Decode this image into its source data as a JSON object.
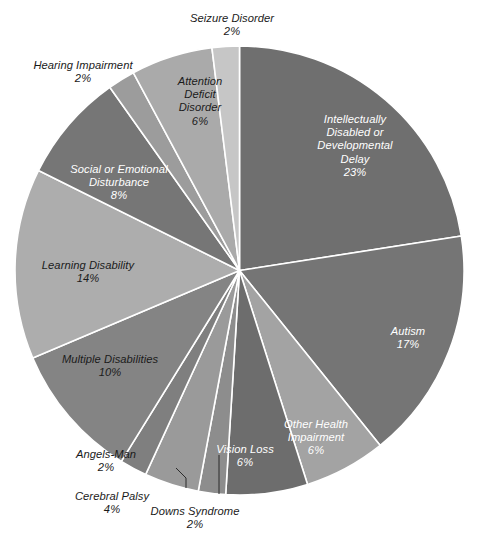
{
  "chart_data": {
    "type": "pie",
    "title": "",
    "subtitle": "",
    "xlabel": "",
    "ylabel": "",
    "legend_position": "none",
    "grid": false,
    "label_format": "name + percent",
    "start_angle_deg": 0,
    "direction": "clockwise",
    "total_percent": 100,
    "categories": [
      "Intellectually Disabled or Developmental Delay",
      "Autism",
      "Other Health Impairment",
      "Vision Loss",
      "Downs Syndrome",
      "Cerebral Palsy",
      "Angels-Man",
      "Multiple Disabilities",
      "Learning Disability",
      "Social or Emotional Disturbance",
      "Hearing Impairment",
      "Attention Deficit Disorder",
      "Seizure Disorder"
    ],
    "values": [
      23,
      17,
      6,
      6,
      2,
      4,
      2,
      10,
      14,
      8,
      2,
      6,
      2
    ],
    "slices": [
      {
        "name": "Intellectually Disabled or Developmental Delay",
        "label": "Intellectually\nDisabled or\nDevelopmental\nDelay",
        "percent_text": "23%",
        "value": 23,
        "color": "#6f6f6f",
        "label_placement": "inside",
        "label_color": "#ffffff"
      },
      {
        "name": "Autism",
        "label": "Autism",
        "percent_text": "17%",
        "value": 17,
        "color": "#757575",
        "label_placement": "inside",
        "label_color": "#ffffff"
      },
      {
        "name": "Other Health Impairment",
        "label": "Other Health\nImpairment",
        "percent_text": "6%",
        "value": 6,
        "color": "#a3a3a3",
        "label_placement": "inside",
        "label_color": "#ffffff"
      },
      {
        "name": "Vision Loss",
        "label": "Vision Loss",
        "percent_text": "6%",
        "value": 6,
        "color": "#6d6d6d",
        "label_placement": "inside",
        "label_color": "#ffffff"
      },
      {
        "name": "Downs Syndrome",
        "label": "Downs Syndrome",
        "percent_text": "2%",
        "value": 2,
        "color": "#8d8d8d",
        "label_placement": "outside-leader",
        "label_color": "#1a1a1a"
      },
      {
        "name": "Cerebral Palsy",
        "label": "Cerebral Palsy",
        "percent_text": "4%",
        "value": 4,
        "color": "#9a9a9a",
        "label_placement": "outside-leader",
        "label_color": "#1a1a1a"
      },
      {
        "name": "Angels-Man",
        "label": "Angels-Man",
        "percent_text": "2%",
        "value": 2,
        "color": "#7f7f7f",
        "label_placement": "outside",
        "label_color": "#1a1a1a"
      },
      {
        "name": "Multiple Disabilities",
        "label": "Multiple Disabilities",
        "percent_text": "10%",
        "value": 10,
        "color": "#848484",
        "label_placement": "inside",
        "label_color": "#1b1b1b"
      },
      {
        "name": "Learning Disability",
        "label": "Learning Disability",
        "percent_text": "14%",
        "value": 14,
        "color": "#adadad",
        "label_placement": "inside",
        "label_color": "#1b1b1b"
      },
      {
        "name": "Social or Emotional Disturbance",
        "label": "Social or Emotional\nDisturbance",
        "percent_text": "8%",
        "value": 8,
        "color": "#767676",
        "label_placement": "inside",
        "label_color": "#ffffff"
      },
      {
        "name": "Hearing Impairment",
        "label": "Hearing Impairment",
        "percent_text": "2%",
        "value": 2,
        "color": "#9c9c9c",
        "label_placement": "outside",
        "label_color": "#1a1a1a"
      },
      {
        "name": "Attention Deficit Disorder",
        "label": "Attention\nDeficit\nDisorder",
        "percent_text": "6%",
        "value": 6,
        "color": "#aaaaaa",
        "label_placement": "inside",
        "label_color": "#1b1b1b"
      },
      {
        "name": "Seizure Disorder",
        "label": "Seizure Disorder",
        "percent_text": "2%",
        "value": 2,
        "color": "#c6c6c6",
        "label_placement": "outside",
        "label_color": "#1a1a1a"
      }
    ]
  },
  "style": {
    "background": "#ffffff",
    "separator_color": "#ffffff",
    "leader_line_color": "#2b2b2b"
  }
}
